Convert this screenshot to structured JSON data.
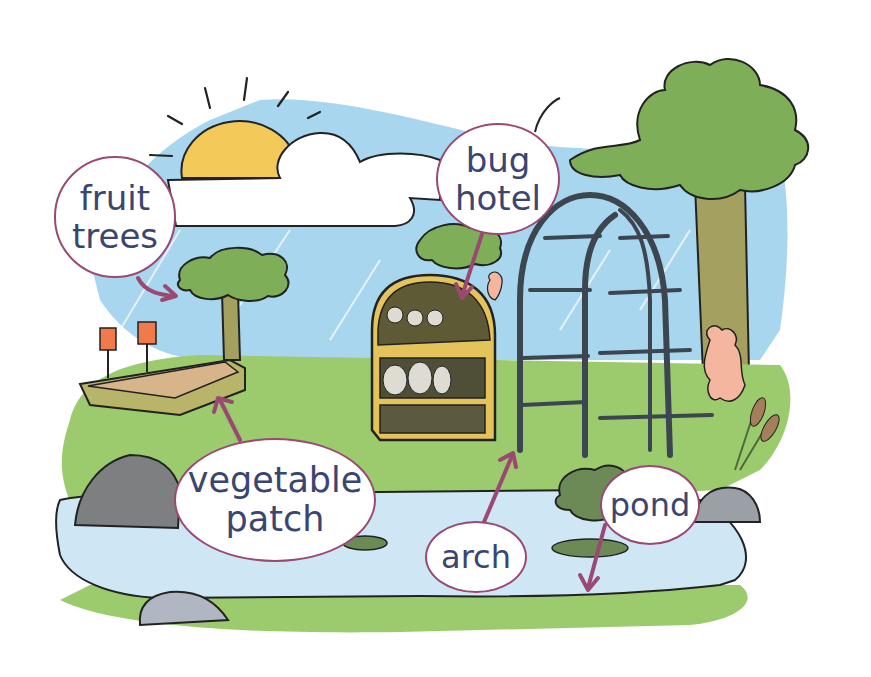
{
  "diagram": {
    "labels": [
      {
        "id": "fruit-trees",
        "lines": [
          "fruit",
          "trees"
        ]
      },
      {
        "id": "bug-hotel",
        "lines": [
          "bug",
          "hotel"
        ]
      },
      {
        "id": "vegetable-patch",
        "lines": [
          "vegetable",
          "patch"
        ]
      },
      {
        "id": "arch",
        "lines": [
          "arch"
        ]
      },
      {
        "id": "pond",
        "lines": [
          "pond"
        ]
      }
    ],
    "colors": {
      "label_border": "#9a4a72",
      "label_text": "#3b4670",
      "arrow": "#9a4a72",
      "sky": "#a9d6ef",
      "grass": "#9ccb6e",
      "pond_water": "#cfe6f4",
      "sun": "#f3c95a",
      "tree_foliage": "#7eae57",
      "trunk": "#a3a060",
      "arch_metal": "#3c4650",
      "bug_hotel_wood": "#e4c45a",
      "rock": "#7d7f80",
      "flower_pink": "#f5b6a0"
    }
  }
}
